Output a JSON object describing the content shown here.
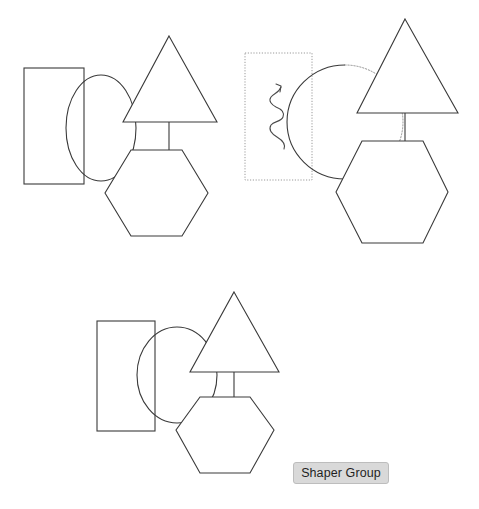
{
  "canvas": {
    "width": 479,
    "height": 509,
    "background": "#ffffff",
    "stroke_color": "#3a3a3a",
    "hidden_stroke_color": "#8d8d8d",
    "selection_stroke_color": "#9a9a9a"
  },
  "label": {
    "text": "Shaper Group",
    "background": "#d9d9d9",
    "border": "#bdbdbd",
    "text_color": "#1f1f1f",
    "x": 293,
    "y": 462,
    "width": 96,
    "height": 22
  },
  "groups": [
    {
      "id": "group-1",
      "name": "shape-group-plain",
      "shapes": [
        {
          "name": "rectangle",
          "type": "rect",
          "x": 24,
          "y": 68,
          "width": 60,
          "height": 116,
          "style": "solid"
        },
        {
          "name": "circle",
          "type": "ellipse",
          "cx": 101,
          "cy": 128,
          "rx": 35,
          "ry": 53,
          "style": "solid-clipped"
        },
        {
          "name": "triangle",
          "type": "triangle",
          "apex_x": 169,
          "apex_y": 36,
          "left_x": 123,
          "right_x": 217,
          "base_y": 122,
          "style": "solid"
        },
        {
          "name": "hexagon",
          "type": "hexagon",
          "cx": 156,
          "cy": 193,
          "rx": 51,
          "ry": 43,
          "style": "solid"
        },
        {
          "name": "connector",
          "type": "line",
          "x1": 169,
          "y1": 122,
          "x2": 169,
          "y2": 150,
          "style": "solid"
        }
      ]
    },
    {
      "id": "group-2",
      "name": "shape-group-selected",
      "shapes": [
        {
          "name": "rectangle",
          "type": "rect",
          "x": 245,
          "y": 53,
          "width": 67,
          "height": 127,
          "style": "dotted-selection"
        },
        {
          "name": "circle",
          "type": "ellipse",
          "cx": 345,
          "cy": 122,
          "rx": 58,
          "ry": 57,
          "style": "dotted-behind"
        },
        {
          "name": "triangle",
          "type": "triangle",
          "apex_x": 405,
          "apex_y": 19,
          "left_x": 357,
          "right_x": 458,
          "base_y": 113,
          "style": "solid"
        },
        {
          "name": "hexagon",
          "type": "hexagon",
          "cx": 392,
          "cy": 192,
          "rx": 56,
          "ry": 51,
          "style": "solid"
        },
        {
          "name": "connector",
          "type": "line",
          "x1": 405,
          "y1": 113,
          "x2": 405,
          "y2": 141,
          "style": "solid"
        },
        {
          "name": "annotation-squiggle-arrow",
          "type": "squiggle",
          "style": "hand-drawn"
        }
      ]
    },
    {
      "id": "group-3",
      "name": "shape-group-outline",
      "shapes": [
        {
          "name": "rectangle",
          "type": "rect",
          "x": 97,
          "y": 321,
          "width": 58,
          "height": 110,
          "style": "solid"
        },
        {
          "name": "circle",
          "type": "ellipse",
          "cx": 177,
          "cy": 375,
          "rx": 40,
          "ry": 48,
          "style": "solid-full"
        },
        {
          "name": "triangle",
          "type": "triangle",
          "apex_x": 234,
          "apex_y": 292,
          "left_x": 190,
          "right_x": 279,
          "base_y": 372,
          "style": "solid"
        },
        {
          "name": "hexagon",
          "type": "hexagon",
          "cx": 225,
          "cy": 430,
          "rx": 49,
          "ry": 43,
          "style": "solid"
        },
        {
          "name": "connector",
          "type": "line",
          "x1": 234,
          "y1": 372,
          "x2": 234,
          "y2": 397,
          "style": "solid"
        }
      ]
    }
  ]
}
